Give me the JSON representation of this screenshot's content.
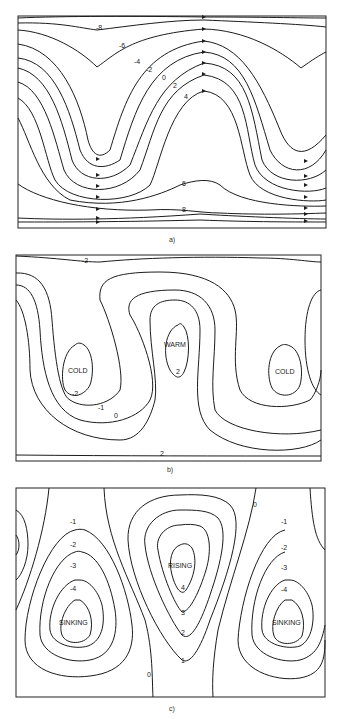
{
  "figure": {
    "panels": [
      {
        "id": "a",
        "caption": "a)",
        "description": "Streamlines with flow arrows (wavy pattern)",
        "contour_labels": [
          "-8",
          "-6",
          "-4",
          "-2",
          "0",
          "2",
          "4",
          "6",
          "8"
        ]
      },
      {
        "id": "b",
        "caption": "b)",
        "description": "Temperature contours",
        "contour_labels": [
          "-2",
          "-2",
          "-1",
          "0",
          "2",
          "2"
        ],
        "region_labels": [
          "COLD",
          "WARM",
          "COLD"
        ]
      },
      {
        "id": "c",
        "caption": "c)",
        "description": "Vertical motion contours",
        "contour_labels_left": [
          "-1",
          "-2",
          "-3",
          "-4"
        ],
        "contour_labels_center": [
          "4",
          "3",
          "2",
          "1"
        ],
        "contour_labels_right": [
          "-1",
          "-2",
          "-3",
          "-4"
        ],
        "zero_labels": [
          "0",
          "0"
        ],
        "region_labels": [
          "SINKING",
          "RISING",
          "SINKING"
        ]
      }
    ]
  }
}
